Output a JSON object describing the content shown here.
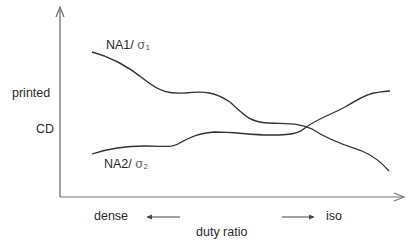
{
  "diagram": {
    "y_axis_label_line1": "printed",
    "y_axis_label_line2": "CD",
    "x_axis_label": "duty ratio",
    "x_left_label": "dense",
    "x_right_label": "iso",
    "curves": [
      {
        "name": "NA1",
        "sigma_symbol": "σ",
        "sigma_index": "1",
        "separator": "/",
        "trend": "decreasing"
      },
      {
        "name": "NA2",
        "sigma_symbol": "σ",
        "sigma_index": "2",
        "separator": "/",
        "trend": "increasing"
      }
    ],
    "colors": {
      "line": "#333333",
      "axis": "#555555",
      "text": "#2a2a2a"
    }
  }
}
